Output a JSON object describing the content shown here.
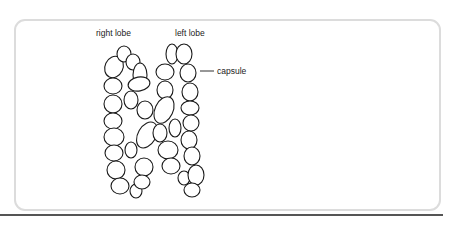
{
  "labels": {
    "right_lobe": "right lobe",
    "left_lobe": "left lobe",
    "capsule": "capsule"
  },
  "colors": {
    "stroke": "#1a1a1a",
    "frame": "#dcdcdc",
    "rule": "#555555"
  }
}
